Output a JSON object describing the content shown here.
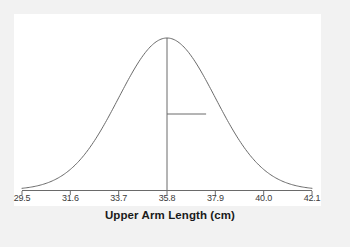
{
  "chart_data": {
    "type": "line",
    "title": "",
    "subtitle": "",
    "xlabel": "Upper Arm Length (cm)",
    "ylabel": "",
    "distribution": "normal",
    "mean": 35.8,
    "sd": 2.1,
    "xlim": [
      29.5,
      42.1
    ],
    "ylim": [
      0,
      1
    ],
    "grid": false,
    "legend": null,
    "tick_labels": [
      "29.5",
      "31.6",
      "33.7",
      "35.8",
      "37.9",
      "40.0",
      "42.1"
    ],
    "tick_values": [
      29.5,
      31.6,
      33.7,
      35.8,
      37.9,
      40.0,
      42.1
    ],
    "x": [
      29.5,
      30.13,
      30.76,
      31.39,
      32.02,
      32.65,
      33.28,
      33.91,
      34.54,
      35.17,
      35.8,
      36.43,
      37.06,
      37.69,
      38.32,
      38.95,
      39.58,
      40.21,
      40.84,
      41.47,
      42.1
    ],
    "y": [
      0.011,
      0.022,
      0.041,
      0.072,
      0.118,
      0.183,
      0.264,
      0.359,
      0.458,
      0.553,
      0.606,
      0.553,
      0.458,
      0.359,
      0.264,
      0.183,
      0.118,
      0.072,
      0.041,
      0.022,
      0.011
    ],
    "annotations": [
      {
        "name": "mean-vertical-line",
        "type": "vline",
        "x": 35.8,
        "y_from": 0,
        "y_to": 1.0,
        "label": ""
      },
      {
        "name": "sd-horizontal-segment",
        "type": "hsegment",
        "x_from": 35.8,
        "x_to": 37.5,
        "y": 0.5,
        "label": ""
      }
    ],
    "colors": {
      "curve": "#6a6a6a",
      "axis": "#6a6a6a",
      "annotation": "#6a6a6a",
      "tick_label": "#3a3a3a",
      "axis_title": "#1a1a1a",
      "panel_background": "#ffffff",
      "figure_background": "#f2f2f2"
    }
  },
  "axis": {
    "title": "Upper Arm Length (cm)",
    "ticks": [
      {
        "label": "29.5"
      },
      {
        "label": "31.6"
      },
      {
        "label": "33.7"
      },
      {
        "label": "35.8"
      },
      {
        "label": "37.9"
      },
      {
        "label": "40.0"
      },
      {
        "label": "42.1"
      }
    ]
  }
}
